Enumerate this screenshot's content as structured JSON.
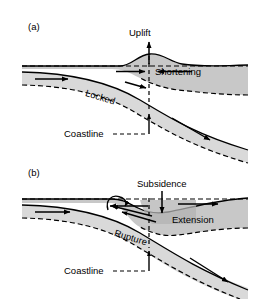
{
  "figure": {
    "background_color": "#ffffff",
    "line_color": "#000000",
    "plate_fill_light": "#d9d9d9",
    "plate_fill_mid": "#c8c8c8",
    "plate_fill_dark": "#b3b3b3",
    "width": 263,
    "height": 299
  },
  "panels": [
    {
      "tag": "(a)",
      "name": "interseismic-locked-stage",
      "labels": {
        "uplift": "Uplift",
        "shortening": "Shortening",
        "locked": "Locked",
        "coastline": "Coastline"
      },
      "arrows": [
        {
          "name": "uplift-arrow",
          "direction": "up"
        },
        {
          "name": "shortening-arrow-right",
          "direction": "right"
        },
        {
          "name": "shortening-arrow-left",
          "direction": "left"
        },
        {
          "name": "subducting-plate-arrow",
          "direction": "right"
        },
        {
          "name": "locked-zone-arrow",
          "direction": "right-down"
        },
        {
          "name": "slab-descent-arrow",
          "direction": "down-right"
        },
        {
          "name": "coastline-pointer-arrow",
          "direction": "up"
        }
      ]
    },
    {
      "tag": "(b)",
      "name": "coseismic-rupture-stage",
      "labels": {
        "subsidence": "Subsidence",
        "extension": "Extension",
        "rupture": "Rupture",
        "coastline": "Coastline"
      },
      "arrows": [
        {
          "name": "subsidence-arrow",
          "direction": "down"
        },
        {
          "name": "extension-arrow-left",
          "direction": "left"
        },
        {
          "name": "extension-arrow-right",
          "direction": "right"
        },
        {
          "name": "subducting-plate-arrow",
          "direction": "right"
        },
        {
          "name": "rupture-slip-arrow",
          "direction": "left"
        },
        {
          "name": "rupture-tip-hook-arrow",
          "direction": "curved-left"
        },
        {
          "name": "slab-descent-arrow",
          "direction": "down-right"
        },
        {
          "name": "coastline-pointer-arrow",
          "direction": "up"
        }
      ]
    }
  ]
}
